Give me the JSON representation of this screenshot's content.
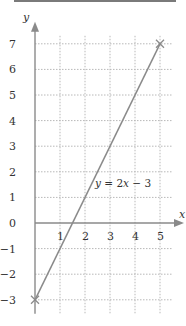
{
  "chart_data": {
    "type": "line",
    "title": "",
    "xlabel": "x",
    "ylabel": "y",
    "xlim": [
      0,
      5
    ],
    "ylim": [
      -3,
      7
    ],
    "grid": true,
    "x_ticks": [
      "1",
      "2",
      "3",
      "4",
      "5"
    ],
    "y_ticks": [
      "7",
      "6",
      "5",
      "4",
      "3",
      "2",
      "1",
      "0",
      "-1",
      "-2",
      "-3"
    ],
    "x_tick_values": [
      1,
      2,
      3,
      4,
      5
    ],
    "y_tick_values": [
      7,
      6,
      5,
      4,
      3,
      2,
      1,
      0,
      -1,
      -2,
      -3
    ],
    "series": [
      {
        "name": "y = 2x − 3",
        "x": [
          0,
          5
        ],
        "y": [
          -3,
          7
        ],
        "endpoint_markers": "cross"
      }
    ],
    "annotations": [
      {
        "text_parts": [
          "y",
          " = 2",
          "x",
          " − 3"
        ],
        "at": [
          2.4,
          1.4
        ]
      }
    ],
    "colors": {
      "line": "#8a8a8a",
      "grid": "#b8b8b8",
      "axis": "#8a8a8a"
    }
  }
}
